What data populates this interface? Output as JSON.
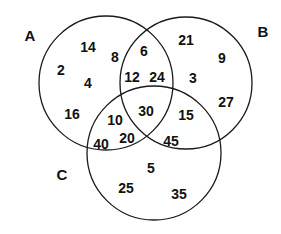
{
  "diagram": {
    "type": "venn",
    "sets": [
      {
        "label": "A",
        "cx": 106,
        "cy": 83,
        "r": 67,
        "label_x": 30,
        "label_y": 37
      },
      {
        "label": "B",
        "cx": 186,
        "cy": 83,
        "r": 66,
        "label_x": 263,
        "label_y": 33
      },
      {
        "label": "C",
        "cx": 154,
        "cy": 153,
        "r": 67,
        "label_x": 62,
        "label_y": 176
      }
    ],
    "regions": [
      {
        "region": "A only",
        "value": "14",
        "x": 88,
        "y": 48
      },
      {
        "region": "A only",
        "value": "8",
        "x": 115,
        "y": 58
      },
      {
        "region": "A only",
        "value": "2",
        "x": 61,
        "y": 71
      },
      {
        "region": "A only",
        "value": "4",
        "x": 88,
        "y": 84
      },
      {
        "region": "A only",
        "value": "16",
        "x": 72,
        "y": 115
      },
      {
        "region": "A and B",
        "value": "6",
        "x": 144,
        "y": 52
      },
      {
        "region": "A and B",
        "value": "12",
        "x": 132,
        "y": 78
      },
      {
        "region": "A and B",
        "value": "24",
        "x": 157,
        "y": 78
      },
      {
        "region": "B only",
        "value": "21",
        "x": 186,
        "y": 41
      },
      {
        "region": "B only",
        "value": "9",
        "x": 222,
        "y": 59
      },
      {
        "region": "B only",
        "value": "3",
        "x": 193,
        "y": 79
      },
      {
        "region": "B only",
        "value": "27",
        "x": 226,
        "y": 103
      },
      {
        "region": "A and C",
        "value": "10",
        "x": 115,
        "y": 121
      },
      {
        "region": "A and C",
        "value": "40",
        "x": 101,
        "y": 145
      },
      {
        "region": "A and C",
        "value": "20",
        "x": 127,
        "y": 139
      },
      {
        "region": "A and B and C",
        "value": "30",
        "x": 146,
        "y": 112
      },
      {
        "region": "B and C",
        "value": "15",
        "x": 186,
        "y": 116
      },
      {
        "region": "B and C",
        "value": "45",
        "x": 171,
        "y": 142
      },
      {
        "region": "C only",
        "value": "5",
        "x": 151,
        "y": 169
      },
      {
        "region": "C only",
        "value": "25",
        "x": 126,
        "y": 189
      },
      {
        "region": "C only",
        "value": "35",
        "x": 179,
        "y": 195
      }
    ]
  }
}
